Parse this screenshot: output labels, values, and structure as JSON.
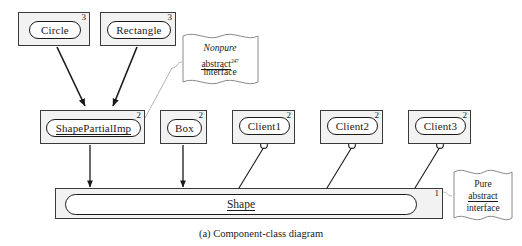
{
  "figure": {
    "caption": "(a) Component-class diagram",
    "colors": {
      "component_fill": "#f2f2f2",
      "component_border": "#3a3a3a",
      "pill_fill": "#ffffff",
      "pill_border": "#1a1a1a",
      "note_border": "#8a8a8a",
      "connector": "#1a1a1a",
      "note_leader": "#b0b0b0",
      "background": "#ffffff"
    }
  },
  "components": [
    {
      "name": "Circle",
      "tier": "3",
      "underline": false,
      "x": 18,
      "y": 12,
      "w": 72,
      "h": 34,
      "pill_x": 10,
      "pill_y": 8,
      "pill_w": 52,
      "pill_h": 18
    },
    {
      "name": "Rectangle",
      "tier": "3",
      "underline": false,
      "x": 100,
      "y": 12,
      "w": 76,
      "h": 34,
      "pill_x": 6,
      "pill_y": 8,
      "pill_w": 64,
      "pill_h": 18
    },
    {
      "name": "ShapePartialImp",
      "tier": "2",
      "underline": true,
      "x": 40,
      "y": 110,
      "w": 105,
      "h": 34,
      "pill_x": 5,
      "pill_y": 8,
      "pill_w": 95,
      "pill_h": 18
    },
    {
      "name": "Box",
      "tier": "2",
      "underline": false,
      "x": 160,
      "y": 110,
      "w": 47,
      "h": 34,
      "pill_x": 6,
      "pill_y": 8,
      "pill_w": 35,
      "pill_h": 18
    },
    {
      "name": "Client1",
      "tier": "2",
      "underline": false,
      "x": 232,
      "y": 110,
      "w": 63,
      "h": 34,
      "pill_x": 6,
      "pill_y": 6,
      "pill_w": 51,
      "pill_h": 18
    },
    {
      "name": "Client2",
      "tier": "2",
      "underline": false,
      "x": 320,
      "y": 110,
      "w": 63,
      "h": 34,
      "pill_x": 6,
      "pill_y": 6,
      "pill_w": 51,
      "pill_h": 18
    },
    {
      "name": "Client3",
      "tier": "2",
      "underline": false,
      "x": 408,
      "y": 110,
      "w": 63,
      "h": 34,
      "pill_x": 6,
      "pill_y": 6,
      "pill_w": 51,
      "pill_h": 18
    }
  ],
  "interface_bar": {
    "name": "Shape",
    "tier": "1",
    "x": 55,
    "y": 188,
    "w": 388,
    "h": 31,
    "inner_x": 9,
    "inner_y": 5,
    "inner_w": 352,
    "inner_h": 21
  },
  "notes": [
    {
      "id": "nonpure-note",
      "x": 182,
      "y": 34,
      "w": 76,
      "h": 52,
      "line1": "Nonpure",
      "line2": "abstract",
      "line2_sup": "247",
      "line3": "interface"
    },
    {
      "id": "pure-note",
      "x": 452,
      "y": 170,
      "w": 60,
      "h": 52,
      "line1": "Pure",
      "line2": "abstract",
      "line2_sup": "",
      "line3": "interface"
    }
  ],
  "sockets": [
    {
      "owner": "Client1",
      "cx": 264,
      "cy": 145
    },
    {
      "owner": "Client2",
      "cx": 352,
      "cy": 145
    },
    {
      "owner": "Client3",
      "cx": 440,
      "cy": 145
    }
  ]
}
